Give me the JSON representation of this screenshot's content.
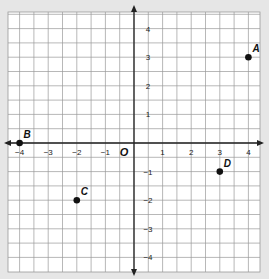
{
  "chart_data": {
    "type": "scatter",
    "title": "",
    "xlabel": "",
    "ylabel": "",
    "origin_label": "O",
    "xlim": [
      -4.4,
      4.4
    ],
    "ylim": [
      -4.5,
      4.5
    ],
    "grid": true,
    "grid_step": 0.5,
    "x_ticks": [
      -4,
      -3,
      -2,
      -1,
      1,
      2,
      3,
      4
    ],
    "x_tick_labels": [
      "−4",
      "−3",
      "−2",
      "−1",
      "1",
      "2",
      "3",
      "4"
    ],
    "y_ticks": [
      4,
      3,
      2,
      1,
      -1,
      -2,
      -3,
      -4
    ],
    "y_tick_labels": [
      "4",
      "3",
      "2",
      "1",
      "−1",
      "−2",
      "−3",
      "−4"
    ],
    "points": [
      {
        "label": "A",
        "x": 4,
        "y": 3
      },
      {
        "label": "B",
        "x": -4,
        "y": 0
      },
      {
        "label": "C",
        "x": -2,
        "y": -2
      },
      {
        "label": "D",
        "x": 3,
        "y": -1
      }
    ]
  },
  "colors": {
    "background": "#e6e6e6",
    "grid_fill": "#ffffff",
    "grid_line": "#9a9a9a",
    "axis": "#222222",
    "point": "#111111"
  }
}
